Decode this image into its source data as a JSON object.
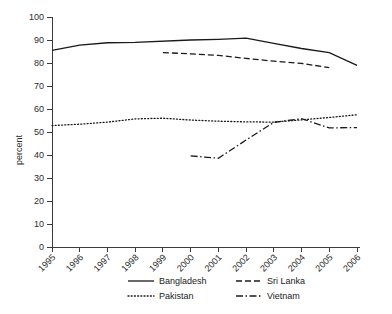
{
  "chart_data": {
    "type": "line",
    "title": "",
    "xlabel": "",
    "ylabel": "percent",
    "ylim": [
      0,
      100
    ],
    "ytick_step": 10,
    "grid": false,
    "legend_position": "bottom",
    "categories": [
      "1995",
      "1996",
      "1997",
      "1998",
      "1999",
      "2000",
      "2001",
      "2002",
      "2003",
      "2004",
      "2005",
      "2006"
    ],
    "yticks": [
      "0",
      "10",
      "20",
      "30",
      "40",
      "50",
      "60",
      "70",
      "80",
      "90",
      "100"
    ],
    "series": [
      {
        "name": "Bangladesh",
        "style": "solid",
        "x": [
          "1995",
          "1996",
          "1997",
          "1998",
          "2000",
          "2001",
          "2002",
          "2003",
          "2004",
          "2005",
          "2006"
        ],
        "values": [
          85.5,
          87.8,
          88.8,
          89.0,
          90.0,
          90.3,
          90.8,
          88.5,
          86.3,
          84.5,
          79.0
        ]
      },
      {
        "name": "Sri Lanka",
        "style": "dashed",
        "x": [
          "1999",
          "2000",
          "2001",
          "2002",
          "2003",
          "2004",
          "2005"
        ],
        "values": [
          84.5,
          84.0,
          83.3,
          82.0,
          80.8,
          79.8,
          78.0
        ]
      },
      {
        "name": "Pakistan",
        "style": "dotted",
        "x": [
          "1995",
          "1996",
          "1997",
          "1998",
          "1999",
          "2000",
          "2001",
          "2002",
          "2003",
          "2004",
          "2005",
          "2006"
        ],
        "values": [
          52.8,
          53.4,
          54.3,
          55.7,
          56.0,
          55.2,
          54.7,
          54.4,
          54.3,
          55.3,
          56.3,
          57.5
        ]
      },
      {
        "name": "Vietnam",
        "style": "dashdot",
        "x": [
          "2000",
          "2001",
          "2002",
          "2003",
          "2004",
          "2005",
          "2006"
        ],
        "values": [
          39.6,
          38.6,
          46.5,
          54.2,
          55.8,
          51.8,
          51.9
        ]
      }
    ]
  },
  "legend": {
    "entries": [
      {
        "label": "Bangladesh",
        "style": "solid"
      },
      {
        "label": "Sri Lanka",
        "style": "dashed"
      },
      {
        "label": "Pakistan",
        "style": "dotted"
      },
      {
        "label": "Vietnam",
        "style": "dashdot"
      }
    ]
  }
}
